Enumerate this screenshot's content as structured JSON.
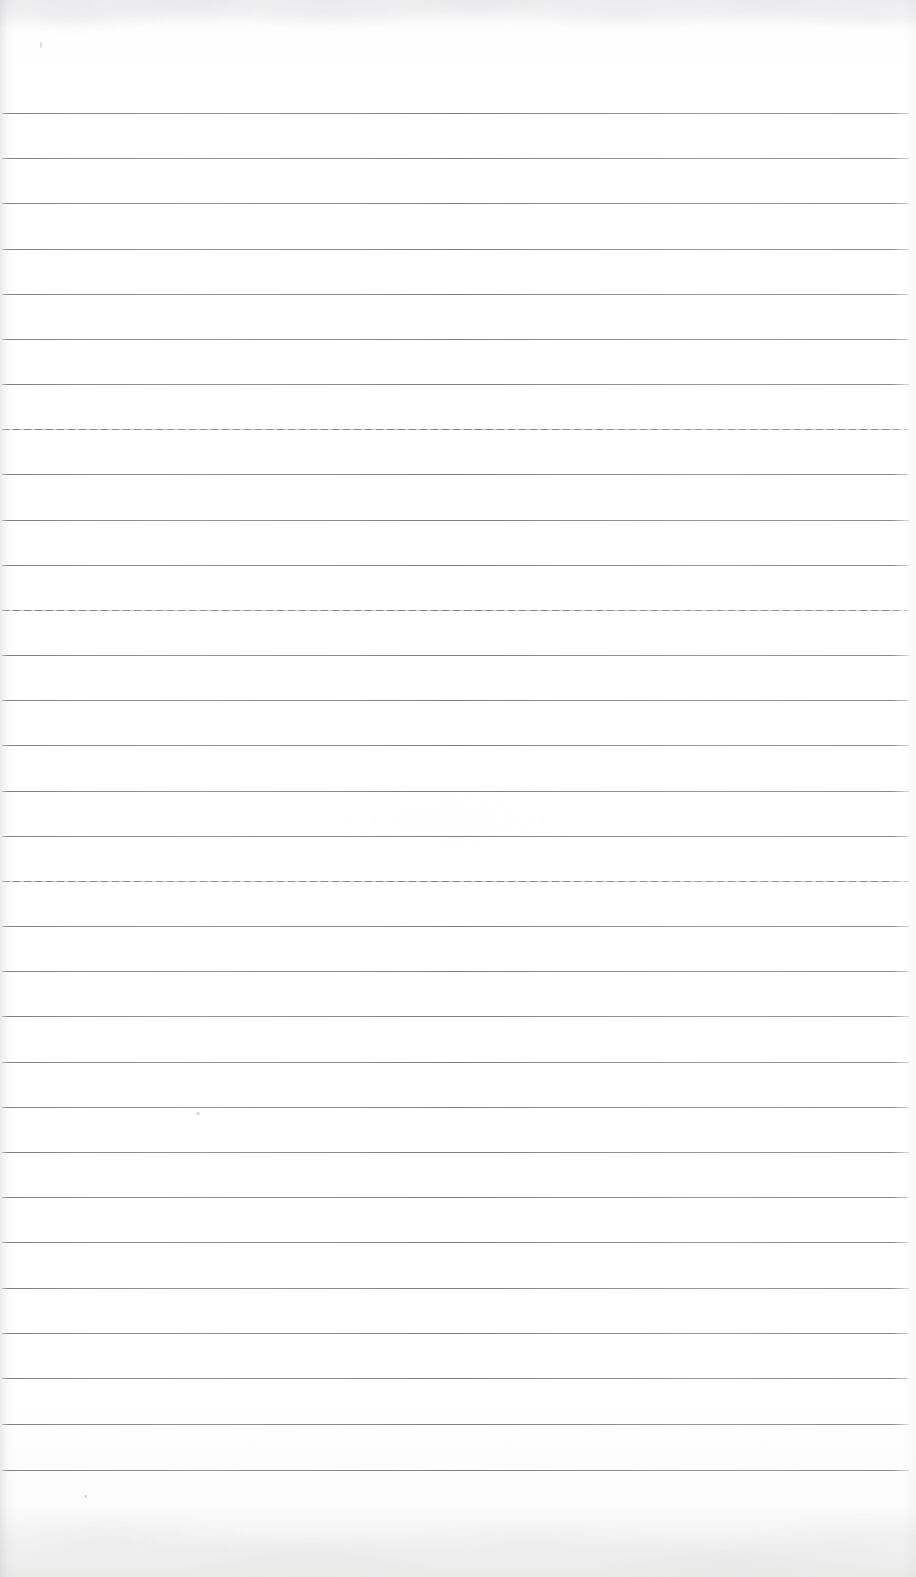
{
  "document": {
    "kind": "scanned-ruled-notebook-page",
    "title": "Blank ruled notebook page (scan)",
    "caption": "A scanned blank sheet of wide-ruled notebook paper with no handwriting or printed text.",
    "page_width_px": 916,
    "page_height_px": 1577,
    "content_text": "",
    "has_handwriting": false,
    "has_printed_text": false
  },
  "colors": {
    "paper_background": "#ffffff",
    "paper_shadow_tint": "#f7f7f6",
    "rule_line": "#7a7a82",
    "rule_line_light": "#b0b0b6",
    "edge_shade": "#b0b0b4"
  },
  "ruling": {
    "style": "wide-ruled",
    "line_count": 31,
    "first_line_y": 113,
    "line_spacing_px": 45.2,
    "line_thickness_px": 1,
    "line_start_x": 2,
    "line_end_x": 909,
    "top_margin_px": 113,
    "bottom_margin_px": 107,
    "left_margin_px": 2,
    "right_margin_px": 7,
    "has_vertical_margin_rule": false,
    "lines": [
      {
        "index": 1,
        "y": 113,
        "textured": false
      },
      {
        "index": 2,
        "y": 158,
        "textured": false
      },
      {
        "index": 3,
        "y": 203,
        "textured": false
      },
      {
        "index": 4,
        "y": 249,
        "textured": false
      },
      {
        "index": 5,
        "y": 294,
        "textured": false
      },
      {
        "index": 6,
        "y": 339,
        "textured": false
      },
      {
        "index": 7,
        "y": 384,
        "textured": false
      },
      {
        "index": 8,
        "y": 429,
        "textured": true
      },
      {
        "index": 9,
        "y": 474,
        "textured": false
      },
      {
        "index": 10,
        "y": 520,
        "textured": false
      },
      {
        "index": 11,
        "y": 565,
        "textured": false
      },
      {
        "index": 12,
        "y": 610,
        "textured": true
      },
      {
        "index": 13,
        "y": 655,
        "textured": false
      },
      {
        "index": 14,
        "y": 700,
        "textured": false
      },
      {
        "index": 15,
        "y": 745,
        "textured": false
      },
      {
        "index": 16,
        "y": 791,
        "textured": false
      },
      {
        "index": 17,
        "y": 836,
        "textured": false
      },
      {
        "index": 18,
        "y": 881,
        "textured": true
      },
      {
        "index": 19,
        "y": 926,
        "textured": false
      },
      {
        "index": 20,
        "y": 971,
        "textured": false
      },
      {
        "index": 21,
        "y": 1016,
        "textured": false
      },
      {
        "index": 22,
        "y": 1062,
        "textured": false
      },
      {
        "index": 23,
        "y": 1107,
        "textured": false
      },
      {
        "index": 24,
        "y": 1152,
        "textured": false
      },
      {
        "index": 25,
        "y": 1197,
        "textured": false
      },
      {
        "index": 26,
        "y": 1242,
        "textured": false
      },
      {
        "index": 27,
        "y": 1288,
        "textured": false
      },
      {
        "index": 28,
        "y": 1333,
        "textured": false
      },
      {
        "index": 29,
        "y": 1378,
        "textured": false
      },
      {
        "index": 30,
        "y": 1424,
        "textured": false
      },
      {
        "index": 31,
        "y": 1470,
        "textured": false
      }
    ]
  },
  "artifacts": {
    "specks": [
      {
        "x": 40,
        "y": 42,
        "w": 2,
        "h": 6
      },
      {
        "x": 196,
        "y": 1112,
        "w": 4,
        "h": 3
      },
      {
        "x": 84,
        "y": 1495,
        "w": 3,
        "h": 3
      }
    ]
  }
}
